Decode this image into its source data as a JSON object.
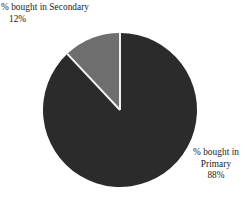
{
  "chart_data": {
    "type": "pie",
    "title": "",
    "subtitle": "",
    "xlabel": "",
    "ylabel": "",
    "legend_position": "none",
    "grid": false,
    "labels_outside": true,
    "start_angle_deg": 0,
    "direction": "counterclockwise-first-slice",
    "categories": [
      "% bought in Secondary",
      "% bought in Primary"
    ],
    "values": [
      12,
      88
    ],
    "value_suffix": "%",
    "slices": [
      {
        "name": "% bought in Secondary",
        "name_line_1": "% bought in Secondary",
        "value": 12,
        "value_label": "12%",
        "color": "#6e6e6e",
        "angle_deg": 43.2,
        "label_position": "top-left"
      },
      {
        "name": "% bought in Primary",
        "name_line_1": "% bought in",
        "name_line_2": "Primary",
        "value": 88,
        "value_label": "88%",
        "color": "#2b2b2b",
        "angle_deg": 316.8,
        "label_position": "bottom-right"
      }
    ],
    "separator_color": "#f2f2f2",
    "background_color": "#ffffff"
  },
  "geometry": {
    "center_x": 120,
    "center_y": 110,
    "radius": 77
  }
}
